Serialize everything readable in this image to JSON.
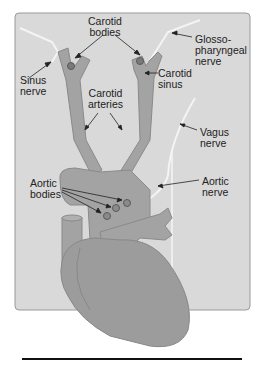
{
  "figure": {
    "type": "anatomical-diagram",
    "colors": {
      "panel_bg": "#d9d9d9",
      "panel_border": "#9a9a9a",
      "vessel_fill": "#a3a3a3",
      "vessel_stroke": "#888888",
      "heart_fill": "#9c9c9c",
      "nerve": "#f2f2f2",
      "body_dot": "#7a7a7a",
      "text": "#222222",
      "arrow": "#222222"
    }
  },
  "labels": {
    "carotid_bodies": "Carotid\nbodies",
    "sinus_nerve": "Sinus\nnerve",
    "glossopharyngeal_nerve": "Glosso-\npharyngeal\nnerve",
    "carotid_sinus": "Carotid\nsinus",
    "carotid_arteries": "Carotid\narteries",
    "vagus_nerve": "Vagus\nnerve",
    "aortic_bodies": "Aortic\nbodies",
    "aortic_nerve": "Aortic\nnerve"
  }
}
